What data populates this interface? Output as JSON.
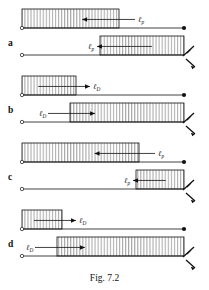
{
  "figure": {
    "caption": "Fig. 7.2",
    "panel_letters": [
      "a",
      "b",
      "c",
      "d"
    ],
    "labels": {
      "ell": "ℓ",
      "sub_p": "p",
      "sub_D": "D"
    },
    "colors": {
      "ink": "#111111",
      "paper": "#ffffff"
    },
    "panels": [
      {
        "letter": "a",
        "rows": [
          {
            "label_main": "ℓ",
            "label_sub": "p",
            "block_x": 22,
            "block_w": 97,
            "arrow_dir": "left",
            "right_end": "dot",
            "line_y": 28
          },
          {
            "label_main": "ℓ",
            "label_sub": "p",
            "block_x": 100,
            "block_w": 84,
            "arrow_dir": "left",
            "right_end": "zigzag",
            "line_y": 55
          }
        ]
      },
      {
        "letter": "b",
        "rows": [
          {
            "label_main": "ℓ",
            "label_sub": "D",
            "block_x": 22,
            "block_w": 54,
            "arrow_dir": "right",
            "right_end": "dot",
            "line_y": 95
          },
          {
            "label_main": "ℓ",
            "label_sub": "D",
            "block_x": 70,
            "block_w": 114,
            "arrow_dir": "right",
            "right_end": "zigzag",
            "line_y": 122
          }
        ]
      },
      {
        "letter": "c",
        "rows": [
          {
            "label_main": "ℓ",
            "label_sub": "p",
            "block_x": 22,
            "block_w": 117,
            "arrow_dir": "left",
            "right_end": "dot",
            "line_y": 162
          },
          {
            "label_main": "ℓ",
            "label_sub": "p",
            "block_x": 136,
            "block_w": 48,
            "arrow_dir": "left",
            "right_end": "zigzag",
            "line_y": 189
          }
        ]
      },
      {
        "letter": "d",
        "rows": [
          {
            "label_main": "ℓ",
            "label_sub": "D",
            "block_x": 22,
            "block_w": 40,
            "arrow_dir": "right",
            "right_end": "dot",
            "line_y": 229
          },
          {
            "label_main": "ℓ",
            "label_sub": "D",
            "block_x": 57,
            "block_w": 127,
            "arrow_dir": "right",
            "right_end": "zigzag",
            "line_y": 256
          }
        ]
      }
    ]
  }
}
